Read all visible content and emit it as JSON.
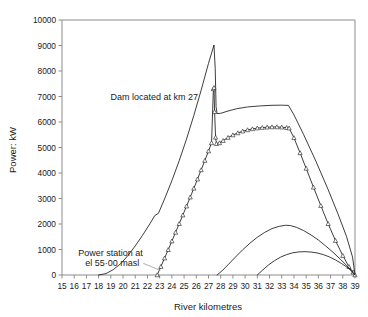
{
  "chart_data": {
    "type": "line",
    "title": "",
    "xlabel": "River kilometres",
    "ylabel": "Power: kW",
    "xlim": [
      15,
      39
    ],
    "ylim": [
      0,
      10000
    ],
    "grid": false,
    "legend": "none",
    "xticks": [
      15,
      16,
      17,
      18,
      19,
      20,
      21,
      22,
      23,
      24,
      25,
      26,
      27,
      28,
      29,
      30,
      31,
      32,
      33,
      34,
      35,
      36,
      37,
      38,
      39
    ],
    "xtick_labels": [
      "15",
      "16",
      "17",
      "18",
      "19",
      "20",
      "21",
      "22",
      "23",
      "24",
      "25",
      "26",
      "27",
      "28",
      "29",
      "30",
      "31",
      "32",
      "33",
      "34",
      "35",
      "36",
      "37",
      "38",
      "39"
    ],
    "yticks": [
      0,
      1000,
      2000,
      3000,
      4000,
      5000,
      6000,
      7000,
      8000,
      9000,
      10000
    ],
    "ytick_labels": [
      "0",
      "1000",
      "2000",
      "3000",
      "4000",
      "5000",
      "6000",
      "7000",
      "8000",
      "9000",
      "10000"
    ],
    "annotations": [
      {
        "name": "dam-annotation",
        "text": "Dam located at km 27",
        "x": 27,
        "y": 7000,
        "leader_to_x": 27.4,
        "leader_to_y": 7250
      },
      {
        "name": "power-station-annotation",
        "text_line1": "Power station at",
        "text_line2": "el 55·00 masl",
        "x": 22.8,
        "y": 500,
        "leader_to_x": 22.9,
        "leader_to_y": 180
      }
    ],
    "series": [
      {
        "name": "upper-envelope-no-dam",
        "marker": "none",
        "points": [
          [
            18.0,
            0
          ],
          [
            18.6,
            55
          ],
          [
            19.2,
            210
          ],
          [
            19.8,
            440
          ],
          [
            20.4,
            760
          ],
          [
            21.0,
            1140
          ],
          [
            21.6,
            1560
          ],
          [
            22.2,
            2010
          ],
          [
            22.6,
            2330
          ],
          [
            22.9,
            2420
          ],
          [
            23.4,
            2980
          ],
          [
            24.0,
            3700
          ],
          [
            24.6,
            4480
          ],
          [
            25.2,
            5330
          ],
          [
            25.8,
            6260
          ],
          [
            26.4,
            7250
          ],
          [
            27.0,
            8300
          ],
          [
            27.45,
            9020
          ],
          [
            27.55,
            8100
          ],
          [
            27.62,
            6600
          ],
          [
            27.7,
            6330
          ],
          [
            28.0,
            6340
          ],
          [
            28.6,
            6430
          ],
          [
            29.3,
            6520
          ],
          [
            30.2,
            6590
          ],
          [
            31.2,
            6630
          ],
          [
            32.2,
            6655
          ],
          [
            33.0,
            6660
          ],
          [
            33.55,
            6650
          ],
          [
            34.0,
            6280
          ],
          [
            34.8,
            5500
          ],
          [
            35.8,
            4460
          ],
          [
            36.8,
            3350
          ],
          [
            37.6,
            2400
          ],
          [
            38.3,
            1520
          ],
          [
            38.8,
            700
          ],
          [
            39.0,
            0
          ]
        ]
      },
      {
        "name": "power-with-dam-markers",
        "marker": "triangle",
        "points": [
          [
            22.8,
            0
          ],
          [
            23.1,
            330
          ],
          [
            23.4,
            660
          ],
          [
            23.7,
            990
          ],
          [
            24.0,
            1330
          ],
          [
            24.3,
            1670
          ],
          [
            24.6,
            2010
          ],
          [
            24.9,
            2350
          ],
          [
            25.2,
            2700
          ],
          [
            25.5,
            3050
          ],
          [
            25.8,
            3400
          ],
          [
            26.1,
            3760
          ],
          [
            26.4,
            4120
          ],
          [
            26.7,
            4490
          ],
          [
            27.0,
            4860
          ],
          [
            27.25,
            5180
          ],
          [
            27.4,
            7300
          ],
          [
            27.45,
            7350
          ],
          [
            27.5,
            6400
          ],
          [
            27.58,
            5400
          ],
          [
            27.65,
            5150
          ],
          [
            27.9,
            5180
          ],
          [
            28.2,
            5270
          ],
          [
            28.6,
            5390
          ],
          [
            29.0,
            5490
          ],
          [
            29.4,
            5570
          ],
          [
            29.8,
            5640
          ],
          [
            30.2,
            5690
          ],
          [
            30.6,
            5730
          ],
          [
            31.0,
            5760
          ],
          [
            31.4,
            5780
          ],
          [
            31.8,
            5795
          ],
          [
            32.2,
            5805
          ],
          [
            32.6,
            5805
          ],
          [
            33.0,
            5795
          ],
          [
            33.4,
            5780
          ],
          [
            33.6,
            5760
          ],
          [
            34.0,
            5380
          ],
          [
            34.5,
            4790
          ],
          [
            35.0,
            4180
          ],
          [
            35.6,
            3440
          ],
          [
            36.2,
            2720
          ],
          [
            36.8,
            2010
          ],
          [
            37.4,
            1350
          ],
          [
            38.0,
            760
          ],
          [
            38.5,
            330
          ],
          [
            38.85,
            110
          ],
          [
            39.0,
            0
          ]
        ]
      },
      {
        "name": "lower-arc-large",
        "marker": "none",
        "points": [
          [
            27.7,
            0
          ],
          [
            28.1,
            160
          ],
          [
            28.6,
            400
          ],
          [
            29.2,
            700
          ],
          [
            29.8,
            990
          ],
          [
            30.4,
            1250
          ],
          [
            31.0,
            1480
          ],
          [
            31.6,
            1670
          ],
          [
            32.2,
            1820
          ],
          [
            32.8,
            1910
          ],
          [
            33.3,
            1950
          ],
          [
            33.7,
            1940
          ],
          [
            34.2,
            1870
          ],
          [
            34.8,
            1740
          ],
          [
            35.4,
            1570
          ],
          [
            36.0,
            1370
          ],
          [
            36.6,
            1140
          ],
          [
            37.2,
            890
          ],
          [
            37.8,
            620
          ],
          [
            38.3,
            380
          ],
          [
            38.7,
            180
          ],
          [
            39.0,
            0
          ]
        ]
      },
      {
        "name": "lower-arc-small",
        "marker": "none",
        "points": [
          [
            31.0,
            0
          ],
          [
            31.4,
            180
          ],
          [
            31.9,
            390
          ],
          [
            32.4,
            560
          ],
          [
            32.9,
            700
          ],
          [
            33.4,
            800
          ],
          [
            33.9,
            870
          ],
          [
            34.4,
            905
          ],
          [
            34.9,
            915
          ],
          [
            35.4,
            900
          ],
          [
            35.9,
            865
          ],
          [
            36.4,
            800
          ],
          [
            36.9,
            710
          ],
          [
            37.4,
            590
          ],
          [
            37.9,
            450
          ],
          [
            38.3,
            320
          ],
          [
            38.7,
            160
          ],
          [
            39.0,
            0
          ]
        ]
      }
    ]
  },
  "axis_color": "#8c8c8c",
  "line_color": "#1a1a1a"
}
